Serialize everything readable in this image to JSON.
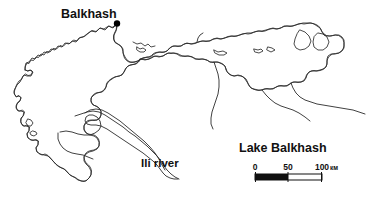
{
  "figure": {
    "kind": "map",
    "title": "Lake Balkhash",
    "background_color": "#ffffff",
    "outline_color": "#2b2b2b"
  },
  "labels": {
    "city": "Balkhash",
    "river": "Ili river",
    "title": "Lake Balkhash"
  },
  "markers": {
    "city_marker_name": "balkhash-city-dot"
  },
  "scale_bar": {
    "ticks": [
      "0",
      "50",
      "100"
    ],
    "unit": "км",
    "segments": [
      {
        "from": "0",
        "to": "50",
        "fill": "#111111"
      },
      {
        "from": "50",
        "to": "100",
        "fill": "#ffffff"
      }
    ]
  },
  "map_fill": {
    "west_basin_color": "#878787",
    "east_basin_color": "#f2f2f2",
    "gradient_note": "west lobe dark gray fading to white toward the east"
  }
}
